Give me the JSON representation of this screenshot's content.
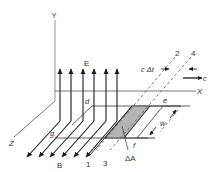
{
  "figure": {
    "colors": {
      "line": "#2a2a2a",
      "axis": "#8a8a8a",
      "shade": "#b4b4b4",
      "text": "#333333"
    },
    "axes": {
      "x_label": "X",
      "y_label": "Y",
      "z_label": "Z"
    },
    "fields": {
      "e_label": "E",
      "b_label": "B"
    },
    "lines": {
      "line_1": "1",
      "line_2": "2",
      "line_3": "3",
      "line_4": "4"
    },
    "points": {
      "d": "d",
      "e": "e",
      "f": "f",
      "g": "g"
    },
    "annotations": {
      "c_delta_t": "c Δt",
      "c": "c",
      "w": "w",
      "delta_a": "ΔA"
    }
  }
}
